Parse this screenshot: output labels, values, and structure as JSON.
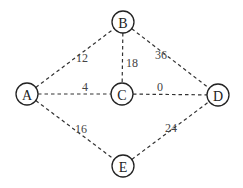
{
  "graph": {
    "nodes": [
      {
        "id": "A",
        "label": "A",
        "x": 27,
        "y": 94
      },
      {
        "id": "B",
        "label": "B",
        "x": 123,
        "y": 22
      },
      {
        "id": "C",
        "label": "C",
        "x": 122,
        "y": 94
      },
      {
        "id": "D",
        "label": "D",
        "x": 218,
        "y": 95
      },
      {
        "id": "E",
        "label": "E",
        "x": 123,
        "y": 166
      }
    ],
    "edges": [
      {
        "from": "A",
        "to": "B",
        "weight": "12",
        "lx": 82,
        "ly": 58
      },
      {
        "from": "B",
        "to": "C",
        "weight": "18",
        "lx": 132,
        "ly": 63
      },
      {
        "from": "B",
        "to": "D",
        "weight": "36",
        "lx": 161,
        "ly": 55
      },
      {
        "from": "A",
        "to": "C",
        "weight": "4",
        "lx": 85,
        "ly": 87
      },
      {
        "from": "C",
        "to": "D",
        "weight": "0",
        "lx": 160,
        "ly": 87
      },
      {
        "from": "A",
        "to": "E",
        "weight": "16",
        "lx": 81,
        "ly": 129
      },
      {
        "from": "E",
        "to": "D",
        "weight": "24",
        "lx": 171,
        "ly": 128
      }
    ]
  }
}
